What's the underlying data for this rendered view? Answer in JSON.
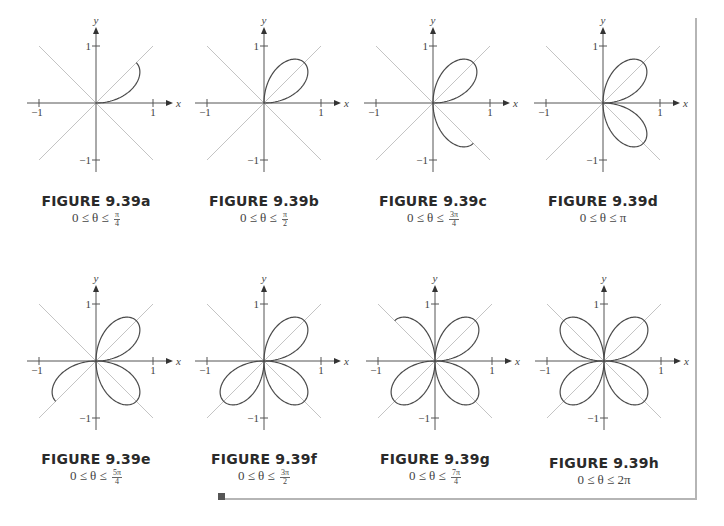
{
  "figures": [
    {
      "id": "a",
      "title": "FIGURE 9.39a",
      "range_prefix": "0 ≤ θ ≤ ",
      "range_num": "π",
      "range_den": "4",
      "range_plain": "",
      "theta_max_over_pi": 0.25,
      "origin": [
        96,
        103
      ]
    },
    {
      "id": "b",
      "title": "FIGURE 9.39b",
      "range_prefix": "0 ≤ θ ≤ ",
      "range_num": "π",
      "range_den": "2",
      "range_plain": "",
      "theta_max_over_pi": 0.5,
      "origin": [
        264,
        103
      ]
    },
    {
      "id": "c",
      "title": "FIGURE 9.39c",
      "range_prefix": "0 ≤ θ ≤ ",
      "range_num": "3π",
      "range_den": "4",
      "range_plain": "",
      "theta_max_over_pi": 0.75,
      "origin": [
        433,
        103
      ]
    },
    {
      "id": "d",
      "title": "FIGURE 9.39d",
      "range_prefix": "0 ≤ θ ≤ ",
      "range_num": "",
      "range_den": "",
      "range_plain": "π",
      "theta_max_over_pi": 1.0,
      "origin": [
        603,
        103
      ]
    },
    {
      "id": "e",
      "title": "FIGURE 9.39e",
      "range_prefix": "0 ≤ θ ≤ ",
      "range_num": "5π",
      "range_den": "4",
      "range_plain": "",
      "theta_max_over_pi": 1.25,
      "origin": [
        96,
        361
      ]
    },
    {
      "id": "f",
      "title": "FIGURE 9.39f",
      "range_prefix": "0 ≤ θ ≤ ",
      "range_num": "3π",
      "range_den": "2",
      "range_plain": "",
      "theta_max_over_pi": 1.5,
      "origin": [
        264,
        361
      ]
    },
    {
      "id": "g",
      "title": "FIGURE 9.39g",
      "range_prefix": "0 ≤ θ ≤ ",
      "range_num": "7π",
      "range_den": "4",
      "range_plain": "",
      "theta_max_over_pi": 1.75,
      "origin": [
        435,
        361
      ]
    },
    {
      "id": "h",
      "title": "FIGURE 9.39h",
      "range_prefix": "0 ≤ θ ≤ ",
      "range_num": "",
      "range_den": "",
      "range_plain": "2π",
      "theta_max_over_pi": 2.0,
      "origin": [
        604,
        361
      ]
    }
  ],
  "axes": {
    "x_label": "x",
    "y_label": "y",
    "tick_pos": "1",
    "tick_neg": "−1",
    "scale_px_per_unit": 57
  },
  "colors": {
    "curve": "#4a4a4a",
    "axis": "#555555",
    "diagonal": "#c4c4c4",
    "rule": "#b5b5b5"
  },
  "chart_data": {
    "type": "line",
    "equation": "r = sin(2θ)",
    "panels": [
      {
        "label": "FIGURE 9.39a",
        "theta_range": "0 ≤ θ ≤ π/4"
      },
      {
        "label": "FIGURE 9.39b",
        "theta_range": "0 ≤ θ ≤ π/2"
      },
      {
        "label": "FIGURE 9.39c",
        "theta_range": "0 ≤ θ ≤ 3π/4"
      },
      {
        "label": "FIGURE 9.39d",
        "theta_range": "0 ≤ θ ≤ π"
      },
      {
        "label": "FIGURE 9.39e",
        "theta_range": "0 ≤ θ ≤ 5π/4"
      },
      {
        "label": "FIGURE 9.39f",
        "theta_range": "0 ≤ θ ≤ 3π/2"
      },
      {
        "label": "FIGURE 9.39g",
        "theta_range": "0 ≤ θ ≤ 7π/4"
      },
      {
        "label": "FIGURE 9.39h",
        "theta_range": "0 ≤ θ ≤ 2π"
      }
    ],
    "xlabel": "x",
    "ylabel": "y",
    "xlim": [
      -1,
      1
    ],
    "ylim": [
      -1,
      1
    ],
    "ticks": [
      -1,
      1
    ],
    "reference_lines": [
      "y = x",
      "y = -x"
    ],
    "grid": false
  }
}
